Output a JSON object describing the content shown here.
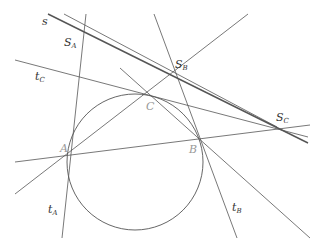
{
  "diagram": {
    "points": {
      "A": {
        "label": "A",
        "x": 70,
        "y": 154
      },
      "B": {
        "label": "B",
        "x": 200,
        "y": 138
      },
      "C": {
        "label": "C",
        "x": 153,
        "y": 95
      },
      "S_A": {
        "label": "S",
        "sub": "A",
        "x": 84,
        "y": 33
      },
      "S_B": {
        "label": "S",
        "sub": "B",
        "x": 177,
        "y": 77
      },
      "S_C": {
        "label": "S",
        "sub": "C",
        "x": 277,
        "y": 127
      }
    },
    "circle": {
      "cx": 135,
      "cy": 162,
      "r": 68
    },
    "lines": [
      {
        "name": "line-s",
        "x1": 48,
        "y1": 14,
        "x2": 308,
        "y2": 143,
        "width": 1.4
      },
      {
        "name": "line-sa-c",
        "x1": 64,
        "y1": 14,
        "x2": 277,
        "y2": 127,
        "width": 0.8
      },
      {
        "name": "tangent-tA",
        "x1": 86,
        "y1": 14,
        "x2": 62,
        "y2": 238,
        "width": 0.8
      },
      {
        "name": "tangent-tB",
        "x1": 154,
        "y1": 14,
        "x2": 237,
        "y2": 238,
        "width": 0.8
      },
      {
        "name": "tangent-tC",
        "x1": 15,
        "y1": 60,
        "x2": 308,
        "y2": 137,
        "width": 0.8
      },
      {
        "name": "line-AB",
        "x1": 15,
        "y1": 162,
        "x2": 310,
        "y2": 125,
        "width": 0.8
      },
      {
        "name": "line-AC",
        "x1": 15,
        "y1": 194,
        "x2": 248,
        "y2": 14,
        "width": 0.8
      },
      {
        "name": "line-CB",
        "x1": 120,
        "y1": 68,
        "x2": 310,
        "y2": 238,
        "width": 0.8
      }
    ],
    "labels": {
      "s": "s",
      "tA": "t",
      "tA_sub": "A",
      "tB": "t",
      "tB_sub": "B",
      "tC": "t",
      "tC_sub": "C",
      "A": "A",
      "B": "B",
      "C": "C",
      "SA": "S",
      "SA_sub": "A",
      "SB": "S",
      "SB_sub": "B",
      "SC": "S",
      "SC_sub": "C"
    },
    "colors": {
      "line": "#555555",
      "circle": "#555555",
      "vertex_label": "#999999",
      "label": "#333333"
    }
  }
}
